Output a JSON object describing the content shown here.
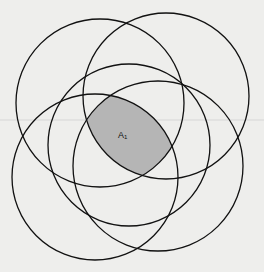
{
  "diagram": {
    "type": "five-circle overlap",
    "background": "#eeeeec",
    "stroke_color": "#111111",
    "shade_color": "#b5b5b5",
    "circles": [
      {
        "id": "c1",
        "cx": 100,
        "cy": 103,
        "r": 84
      },
      {
        "id": "c2",
        "cx": 166,
        "cy": 96,
        "r": 83
      },
      {
        "id": "c3",
        "cx": 129,
        "cy": 145,
        "r": 81
      },
      {
        "id": "c4",
        "cx": 95,
        "cy": 177,
        "r": 83
      },
      {
        "id": "c5",
        "cx": 158,
        "cy": 166,
        "r": 85
      }
    ],
    "shaded_region": {
      "description": "intersection of all five circles",
      "label": "A",
      "label_subscript": "1",
      "label_x": 118,
      "label_y": 138
    }
  }
}
